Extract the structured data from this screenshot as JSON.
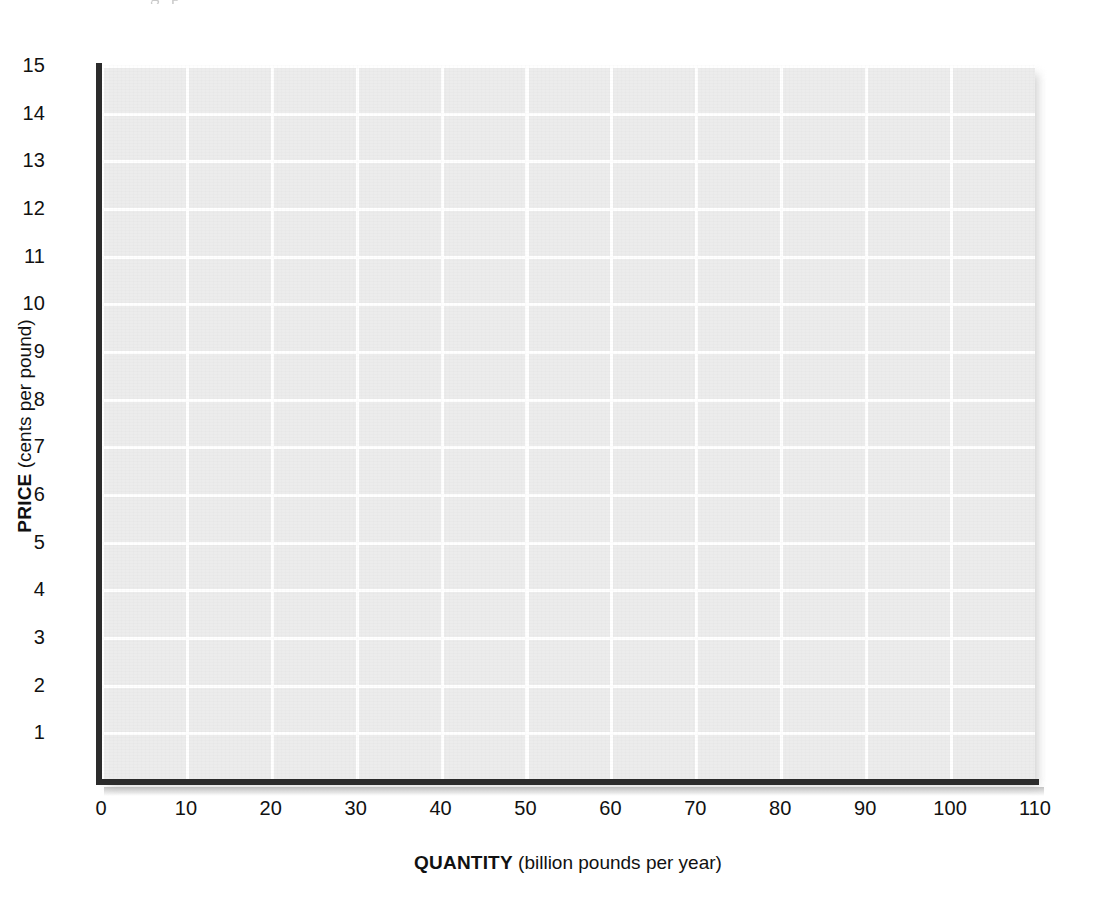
{
  "figure": {
    "clipped_text_above": "g      p",
    "background_color": "#ffffff",
    "plot_background_color": "#ececec",
    "gridline_color": "#ffffff",
    "axis_color": "#2b2b2b"
  },
  "chart_data": {
    "type": "line",
    "title": "",
    "subtitle": "",
    "xlabel_bold": "QUANTITY",
    "xlabel_unit": "(billion pounds per year)",
    "ylabel_bold": "PRICE",
    "ylabel_unit": "(cents per pound)",
    "xlim": [
      0,
      110
    ],
    "ylim": [
      0,
      15
    ],
    "xticks": [
      0,
      10,
      20,
      30,
      40,
      50,
      60,
      70,
      80,
      90,
      100,
      110
    ],
    "xtick_labels": [
      "0",
      "10",
      "20",
      "30",
      "40",
      "50",
      "60",
      "70",
      "80",
      "90",
      "100",
      "110"
    ],
    "yticks": [
      1,
      2,
      3,
      4,
      5,
      6,
      7,
      8,
      9,
      10,
      11,
      12,
      13,
      14,
      15
    ],
    "ytick_labels": [
      "1",
      "2",
      "3",
      "4",
      "5",
      "6",
      "7",
      "8",
      "9",
      "10",
      "11",
      "12",
      "13",
      "14",
      "15"
    ],
    "grid": true,
    "grid_style": "white lines on light gray panel",
    "legend": null,
    "legend_position": "none",
    "series": [],
    "annotations": []
  },
  "axes": {
    "x": {
      "title_bold": "QUANTITY",
      "title_unit": "(billion pounds per year)",
      "ticks": [
        "0",
        "10",
        "20",
        "30",
        "40",
        "50",
        "60",
        "70",
        "80",
        "90",
        "100",
        "110"
      ]
    },
    "y": {
      "title_bold": "PRICE",
      "title_unit": "(cents per pound)",
      "ticks": [
        "15",
        "14",
        "13",
        "12",
        "11",
        "10",
        "9",
        "8",
        "7",
        "6",
        "5",
        "4",
        "3",
        "2",
        "1"
      ]
    }
  }
}
